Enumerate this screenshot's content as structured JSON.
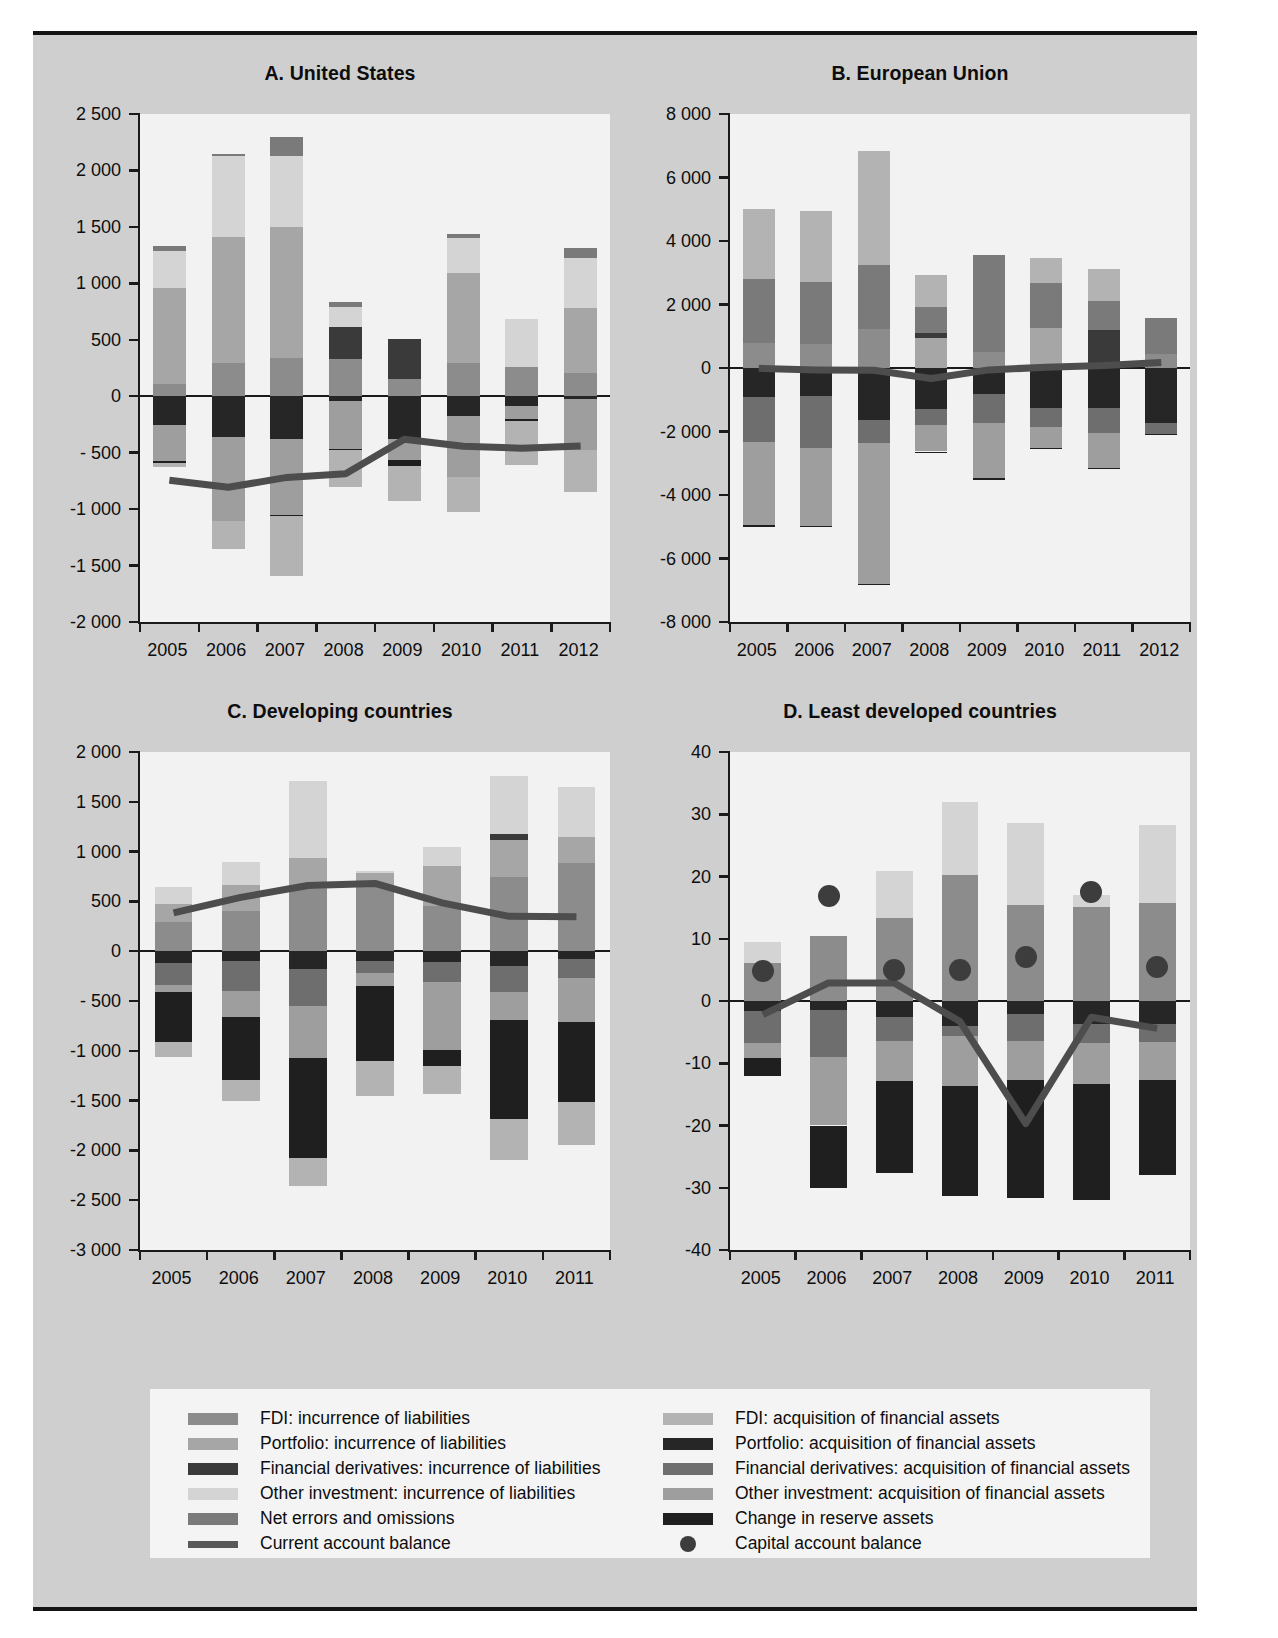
{
  "figure": {
    "background": "#cfcfcf",
    "panel_background": "#f2f2f2",
    "rule_color": "#141414"
  },
  "colors": {
    "fdi_liab": "#8c8c8c",
    "portfolio_liab": "#a6a6a6",
    "deriv_liab": "#3a3a3a",
    "other_liab": "#d4d4d4",
    "net_errors": "#7a7a7a",
    "fdi_asset": "#b3b3b3",
    "portfolio_asset": "#262626",
    "deriv_asset": "#6e6e6e",
    "other_asset": "#9e9e9e",
    "reserve_assets": "#1f1f1f",
    "current_account_line": "#4d4d4d",
    "capital_account_dot": "#3d3d3d"
  },
  "legend": {
    "left": [
      {
        "label": "FDI: incurrence of liabilities",
        "marker": "swatch",
        "color": "#8c8c8c",
        "key": "fdi_liab"
      },
      {
        "label": "Portfolio: incurrence of liabilities",
        "marker": "swatch",
        "color": "#a6a6a6",
        "key": "portfolio_liab"
      },
      {
        "label": "Financial derivatives: incurrence of liabilities",
        "marker": "swatch",
        "color": "#3a3a3a",
        "key": "deriv_liab"
      },
      {
        "label": "Other investment: incurrence of liabilities",
        "marker": "swatch",
        "color": "#d4d4d4",
        "key": "other_liab"
      },
      {
        "label": "Net errors and omissions",
        "marker": "swatch",
        "color": "#7a7a7a",
        "key": "net_errors"
      },
      {
        "label": "Current account balance",
        "marker": "line",
        "color": "#595959",
        "key": "current_account"
      }
    ],
    "right": [
      {
        "label": "FDI: acquisition of financial assets",
        "marker": "swatch",
        "color": "#b3b3b3",
        "key": "fdi_asset"
      },
      {
        "label": "Portfolio: acquisition of financial assets",
        "marker": "swatch",
        "color": "#262626",
        "key": "portfolio_asset"
      },
      {
        "label": "Financial derivatives: acquisition of financial assets",
        "marker": "swatch",
        "color": "#6e6e6e",
        "key": "deriv_asset"
      },
      {
        "label": "Other investment: acquisition of financial assets",
        "marker": "swatch",
        "color": "#9e9e9e",
        "key": "other_asset"
      },
      {
        "label": "Change in reserve assets",
        "marker": "swatch",
        "color": "#1f1f1f",
        "key": "reserve_assets"
      },
      {
        "label": "Capital account balance",
        "marker": "dot",
        "color": "#3d3d3d",
        "key": "capital_account"
      }
    ]
  },
  "chart_data": [
    {
      "id": "panel-a",
      "type": "bar",
      "title": "A. United States",
      "xlabel": "",
      "ylabel": "",
      "categories": [
        "2005",
        "2006",
        "2007",
        "2008",
        "2009",
        "2010",
        "2011",
        "2012"
      ],
      "ylim": [
        -2000,
        2500
      ],
      "yticks": [
        -2000,
        -1500,
        -1000,
        -500,
        0,
        500,
        1000,
        1500,
        2000,
        2500
      ],
      "ytick_labels": [
        "-2 000",
        "-1 500",
        "-1 000",
        "- 500",
        "0",
        "500",
        "1 000",
        "1 500",
        "2 000",
        "2 500"
      ],
      "grid": false,
      "legend_position": "below-figure",
      "stacked": true,
      "series": [
        {
          "name": "FDI: incurrence of liabilities",
          "key": "fdi_liab",
          "values": [
            112,
            298,
            340,
            332,
            150,
            290,
            260,
            206
          ]
        },
        {
          "name": "Portfolio: incurrence of liabilities",
          "key": "portfolio_liab",
          "values": [
            843,
            1115,
            1155,
            0,
            0,
            800,
            0,
            578
          ]
        },
        {
          "name": "Financial derivatives: incurrence of liabilities",
          "key": "deriv_liab",
          "values": [
            0,
            0,
            0,
            283,
            355,
            0,
            0,
            0
          ]
        },
        {
          "name": "Other investment: incurrence of liabilities",
          "key": "other_liab",
          "values": [
            335,
            712,
            635,
            175,
            0,
            310,
            420,
            440
          ]
        },
        {
          "name": "Net errors and omissions",
          "key": "net_errors",
          "values": [
            40,
            25,
            165,
            45,
            0,
            40,
            0,
            92
          ]
        },
        {
          "name": "FDI: acquisition of financial assets",
          "key": "fdi_asset",
          "values": [
            -36,
            -245,
            -532,
            -330,
            -310,
            -304,
            -397,
            -367
          ]
        },
        {
          "name": "Portfolio: acquisition of financial assets",
          "key": "portfolio_asset",
          "values": [
            -257,
            -365,
            -381,
            -38,
            -375,
            -172,
            -85,
            -24
          ]
        },
        {
          "name": "Financial derivatives: acquisition of financial assets",
          "key": "deriv_asset",
          "values": [
            0,
            0,
            0,
            0,
            0,
            0,
            0,
            0
          ]
        },
        {
          "name": "Other investment: acquisition of financial assets",
          "key": "other_asset",
          "values": [
            -320,
            -740,
            -672,
            -432,
            -187,
            -545,
            -115,
            -451
          ]
        },
        {
          "name": "Change in reserve assets",
          "key": "reserve_assets",
          "values": [
            -14,
            -2,
            -5,
            -5,
            -52,
            -2,
            -16,
            -5
          ]
        }
      ],
      "line": {
        "name": "Current account balance",
        "values": [
          -745,
          -807,
          -719,
          -687,
          -381,
          -444,
          -460,
          -440
        ]
      },
      "dots": {
        "name": "Capital account balance",
        "values": [
          null,
          null,
          null,
          null,
          null,
          null,
          null,
          null
        ]
      }
    },
    {
      "id": "panel-b",
      "type": "bar",
      "title": "B. European Union",
      "xlabel": "",
      "ylabel": "",
      "categories": [
        "2005",
        "2006",
        "2007",
        "2008",
        "2009",
        "2010",
        "2011",
        "2012"
      ],
      "ylim": [
        -8000,
        8000
      ],
      "yticks": [
        -8000,
        -6000,
        -4000,
        -2000,
        0,
        2000,
        4000,
        6000,
        8000
      ],
      "ytick_labels": [
        "-8 000",
        "-6 000",
        "-4 000",
        "-2 000",
        "0",
        "2 000",
        "4 000",
        "6 000",
        "8 000"
      ],
      "grid": false,
      "legend_position": "below-figure",
      "stacked": true,
      "series": [
        {
          "name": "FDI: incurrence of liabilities",
          "key": "fdi_liab",
          "values": [
            800,
            760,
            1235,
            0,
            515,
            0,
            0,
            432
          ]
        },
        {
          "name": "Portfolio: incurrence of liabilities",
          "key": "portfolio_liab",
          "values": [
            0,
            0,
            0,
            930,
            0,
            1250,
            0,
            0
          ]
        },
        {
          "name": "Financial derivatives: incurrence of liabilities",
          "key": "deriv_liab",
          "values": [
            0,
            0,
            0,
            175,
            0,
            0,
            1185,
            0
          ]
        },
        {
          "name": "Other investment: incurrence of liabilities",
          "key": "other_liab",
          "values": [
            0,
            0,
            0,
            0,
            0,
            0,
            0,
            0
          ]
        },
        {
          "name": "Net errors and omissions",
          "key": "net_errors",
          "values": [
            1995,
            1955,
            2010,
            805,
            3040,
            1425,
            915,
            1150
          ]
        },
        {
          "name": "FDI: acquisition of financial assets",
          "key": "fdi_asset",
          "values": [
            2200,
            2245,
            3605,
            1005,
            0,
            800,
            1020,
            0
          ]
        },
        {
          "name": "Portfolio: acquisition of financial assets",
          "key": "portfolio_asset",
          "values": [
            -900,
            -880,
            -1625,
            -1295,
            -805,
            -1270,
            -1250,
            -1730
          ]
        },
        {
          "name": "Financial derivatives: acquisition of financial assets",
          "key": "deriv_asset",
          "values": [
            -1430,
            -1625,
            -745,
            -505,
            -935,
            -575,
            -795,
            -345
          ]
        },
        {
          "name": "Other investment: acquisition of financial assets",
          "key": "other_asset",
          "values": [
            -2630,
            -2475,
            -4440,
            -830,
            -1715,
            -665,
            -1095,
            0
          ]
        },
        {
          "name": "Change in reserve assets",
          "key": "reserve_assets",
          "values": [
            -45,
            -35,
            -20,
            -25,
            -85,
            -45,
            -55,
            -30
          ]
        }
      ],
      "line": {
        "name": "Current account balance",
        "values": [
          -10,
          -60,
          -70,
          -330,
          -60,
          25,
          75,
          170
        ]
      },
      "dots": {
        "name": "Capital account balance",
        "values": [
          null,
          null,
          null,
          null,
          null,
          null,
          null,
          null
        ]
      }
    },
    {
      "id": "panel-c",
      "type": "bar",
      "title": "C. Developing countries",
      "xlabel": "",
      "ylabel": "",
      "categories": [
        "2005",
        "2006",
        "2007",
        "2008",
        "2009",
        "2010",
        "2011"
      ],
      "ylim": [
        -3000,
        2000
      ],
      "yticks": [
        -3000,
        -2500,
        -2000,
        -1500,
        -1000,
        -500,
        0,
        500,
        1000,
        1500,
        2000
      ],
      "ytick_labels": [
        "-3 000",
        "-2 500",
        "-2 000",
        "-1 500",
        "-1 000",
        "- 500",
        "0",
        "500",
        "1 000",
        "1 500",
        "2 000"
      ],
      "grid": false,
      "legend_position": "below-figure",
      "stacked": true,
      "series": [
        {
          "name": "FDI: incurrence of liabilities",
          "key": "fdi_liab",
          "values": [
            290,
            405,
            625,
            655,
            455,
            740,
            890
          ]
        },
        {
          "name": "Portfolio: incurrence of liabilities",
          "key": "portfolio_liab",
          "values": [
            185,
            255,
            310,
            130,
            405,
            380,
            255
          ]
        },
        {
          "name": "Financial derivatives: incurrence of liabilities",
          "key": "deriv_liab",
          "values": [
            0,
            0,
            0,
            0,
            0,
            55,
            0
          ]
        },
        {
          "name": "Other investment: incurrence of liabilities",
          "key": "other_liab",
          "values": [
            165,
            235,
            775,
            20,
            190,
            580,
            500
          ]
        },
        {
          "name": "Net errors and omissions",
          "key": "net_errors",
          "values": [
            0,
            0,
            0,
            0,
            0,
            0,
            0
          ]
        },
        {
          "name": "FDI: acquisition of financial assets",
          "key": "fdi_asset",
          "values": [
            -150,
            -215,
            -280,
            -355,
            -275,
            -415,
            -440
          ]
        },
        {
          "name": "Portfolio: acquisition of financial assets",
          "key": "portfolio_asset",
          "values": [
            -115,
            -100,
            -175,
            -100,
            -105,
            -150,
            -80
          ]
        },
        {
          "name": "Financial derivatives: acquisition of financial assets",
          "key": "deriv_asset",
          "values": [
            -225,
            -300,
            -375,
            -120,
            -200,
            -260,
            -185
          ]
        },
        {
          "name": "Other investment: acquisition of financial assets",
          "key": "other_asset",
          "values": [
            -70,
            -265,
            -525,
            -130,
            -690,
            -285,
            -445
          ]
        },
        {
          "name": "Change in reserve assets",
          "key": "reserve_assets",
          "values": [
            -500,
            -625,
            -1000,
            -750,
            -160,
            -990,
            -800
          ]
        }
      ],
      "line": {
        "name": "Current account balance",
        "values": [
          385,
          540,
          660,
          680,
          485,
          350,
          345
        ]
      },
      "dots": {
        "name": "Capital account balance",
        "values": [
          null,
          null,
          null,
          null,
          null,
          null,
          null
        ]
      }
    },
    {
      "id": "panel-d",
      "type": "bar",
      "title": "D. Least developed countries",
      "xlabel": "",
      "ylabel": "",
      "categories": [
        "2005",
        "2006",
        "2007",
        "2008",
        "2009",
        "2010",
        "2011"
      ],
      "ylim": [
        -40,
        40
      ],
      "yticks": [
        -40,
        -30,
        -20,
        -10,
        0,
        10,
        20,
        30,
        40
      ],
      "ytick_labels": [
        "-40",
        "-30",
        "-20",
        "-10",
        "0",
        "10",
        "20",
        "30",
        "40"
      ],
      "grid": false,
      "legend_position": "below-figure",
      "stacked": true,
      "series": [
        {
          "name": "FDI: incurrence of liabilities",
          "key": "fdi_liab",
          "values": [
            6.1,
            10.4,
            13.4,
            20.3,
            15.4,
            15.1,
            15.7
          ]
        },
        {
          "name": "Portfolio: incurrence of liabilities",
          "key": "portfolio_liab",
          "values": [
            0,
            0,
            0,
            0,
            0,
            0,
            0
          ]
        },
        {
          "name": "Financial derivatives: incurrence of liabilities",
          "key": "deriv_liab",
          "values": [
            0,
            0,
            0,
            0,
            0,
            0,
            0
          ]
        },
        {
          "name": "Other investment: incurrence of liabilities",
          "key": "other_liab",
          "values": [
            3.3,
            0,
            7.5,
            11.7,
            13.2,
            2.0,
            12.6
          ]
        },
        {
          "name": "Net errors and omissions",
          "key": "net_errors",
          "values": [
            0,
            0,
            0,
            0,
            0,
            0,
            0
          ]
        },
        {
          "name": "FDI: acquisition of financial assets",
          "key": "fdi_asset",
          "values": [
            0,
            0,
            0,
            0,
            0,
            0,
            0
          ]
        },
        {
          "name": "Portfolio: acquisition of financial assets",
          "key": "portfolio_asset",
          "values": [
            -1.6,
            -1.4,
            -2.6,
            -4.0,
            -2.1,
            -3.7,
            -3.7
          ]
        },
        {
          "name": "Financial derivatives: acquisition of financial assets",
          "key": "deriv_asset",
          "values": [
            -5.2,
            -7.6,
            -3.9,
            -1.7,
            -4.4,
            -3.0,
            -2.9
          ]
        },
        {
          "name": "Other investment: acquisition of financial assets",
          "key": "other_asset",
          "values": [
            -2.3,
            -11.0,
            -6.3,
            -8.0,
            -6.2,
            -6.6,
            -6.1
          ]
        },
        {
          "name": "Change in reserve assets",
          "key": "reserve_assets",
          "values": [
            -3.0,
            -10.0,
            -14.8,
            -17.7,
            -19.0,
            -18.7,
            -15.3
          ]
        }
      ],
      "line": {
        "name": "Current account balance",
        "values": [
          -2.2,
          2.9,
          2.9,
          -3.3,
          -19.7,
          -2.6,
          -4.4
        ]
      },
      "dots": {
        "name": "Capital account balance",
        "values": [
          4.8,
          16.9,
          4.9,
          4.9,
          7.1,
          17.5,
          5.5
        ]
      }
    }
  ]
}
